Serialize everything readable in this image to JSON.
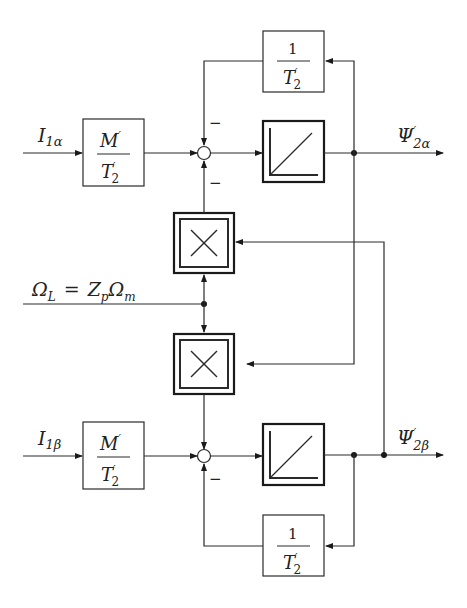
{
  "diagram": {
    "type": "block-diagram",
    "title": "",
    "inputs": {
      "alpha": {
        "symbol": "I",
        "subscript": "1α"
      },
      "beta": {
        "symbol": "I",
        "subscript": "1β"
      },
      "speed": {
        "text_left": "Ω",
        "sub_left": "L",
        "eq": "=",
        "z": "Z",
        "z_sub": "p",
        "omega": "Ω",
        "omega_sub": "m"
      }
    },
    "gain_blocks": {
      "mt_alpha": {
        "numerator": "M",
        "num_prime": "′",
        "denominator": "T",
        "den_prime": "′",
        "den_sub": "2"
      },
      "mt_beta": {
        "numerator": "M",
        "num_prime": "′",
        "denominator": "T",
        "den_prime": "′",
        "den_sub": "2"
      },
      "inv_t_alpha": {
        "numerator": "1",
        "denominator": "T",
        "den_prime": "′",
        "den_sub": "2"
      },
      "inv_t_beta": {
        "numerator": "1",
        "denominator": "T",
        "den_prime": "′",
        "den_sub": "2"
      }
    },
    "signs": {
      "alpha_top": "−",
      "alpha_bottom": "−",
      "beta_bottom": "−"
    },
    "blocks": {
      "integrator_alpha": "integrator",
      "integrator_beta": "integrator",
      "multiplier_top": "×",
      "multiplier_bottom": "×"
    },
    "outputs": {
      "alpha": {
        "symbol": "Ψ",
        "prime": "′",
        "subscript": "2α"
      },
      "beta": {
        "symbol": "Ψ",
        "prime": "′",
        "subscript": "2β"
      }
    }
  }
}
